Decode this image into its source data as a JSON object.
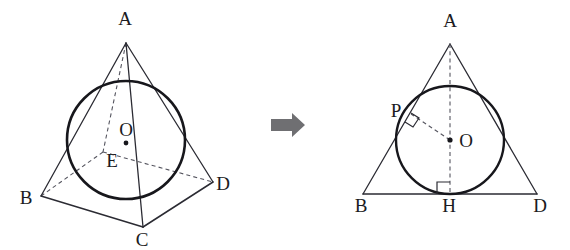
{
  "figure": {
    "background_color": "#ffffff",
    "ink_color": "#1b1b22",
    "hidden_edge_color": "#55555f",
    "arrow_color": "#6f6f72",
    "transition": {
      "icon": "right-arrow-icon",
      "direction": "right"
    },
    "left_diagram": {
      "name": "square-pyramid-with-inscribed-sphere",
      "type": "3d-solid",
      "labels": [
        {
          "id": "A",
          "text": "A",
          "x": 125,
          "y": 25,
          "role": "apex"
        },
        {
          "id": "B",
          "text": "B",
          "x": 26,
          "y": 204,
          "role": "base-vertex"
        },
        {
          "id": "C",
          "text": "C",
          "x": 142,
          "y": 246,
          "role": "base-vertex"
        },
        {
          "id": "D",
          "text": "D",
          "x": 223,
          "y": 190,
          "role": "base-vertex"
        },
        {
          "id": "E",
          "text": "E",
          "x": 112,
          "y": 167,
          "role": "base-center"
        },
        {
          "id": "O",
          "text": "O",
          "x": 126,
          "y": 136,
          "role": "sphere-center"
        }
      ],
      "points": {
        "A": [
          126,
          43
        ],
        "B": [
          41,
          196
        ],
        "C": [
          143,
          227
        ],
        "D": [
          213,
          182
        ],
        "F": [
          103,
          152
        ],
        "E": [
          113,
          153
        ],
        "O": [
          126,
          143
        ]
      },
      "sphere": {
        "cx": 126,
        "cy": 140,
        "r": 59
      }
    },
    "right_diagram": {
      "name": "isosceles-triangle-with-incircle",
      "type": "2d-cross-section",
      "labels": [
        {
          "id": "A",
          "text": "A",
          "x": 450,
          "y": 27,
          "role": "apex"
        },
        {
          "id": "P",
          "text": "P",
          "x": 396,
          "y": 117,
          "role": "tangent-point"
        },
        {
          "id": "O",
          "text": "O",
          "x": 466,
          "y": 147,
          "role": "incircle-center"
        },
        {
          "id": "B",
          "text": "B",
          "x": 361,
          "y": 212,
          "role": "base-left"
        },
        {
          "id": "H",
          "text": "H",
          "x": 449,
          "y": 212,
          "role": "foot-of-altitude"
        },
        {
          "id": "D",
          "text": "D",
          "x": 540,
          "y": 212,
          "role": "base-right"
        }
      ],
      "points": {
        "A": [
          450,
          44
        ],
        "B": [
          363,
          194
        ],
        "D": [
          537,
          194
        ],
        "H": [
          450,
          194
        ],
        "O": [
          450,
          140
        ],
        "P": [
          411,
          114
        ]
      },
      "incircle": {
        "cx": 450,
        "cy": 140,
        "r": 54
      },
      "right_angle_marks": [
        {
          "at": "P",
          "name": "right-angle-at-p"
        },
        {
          "at": "H",
          "name": "right-angle-at-h"
        }
      ]
    }
  }
}
